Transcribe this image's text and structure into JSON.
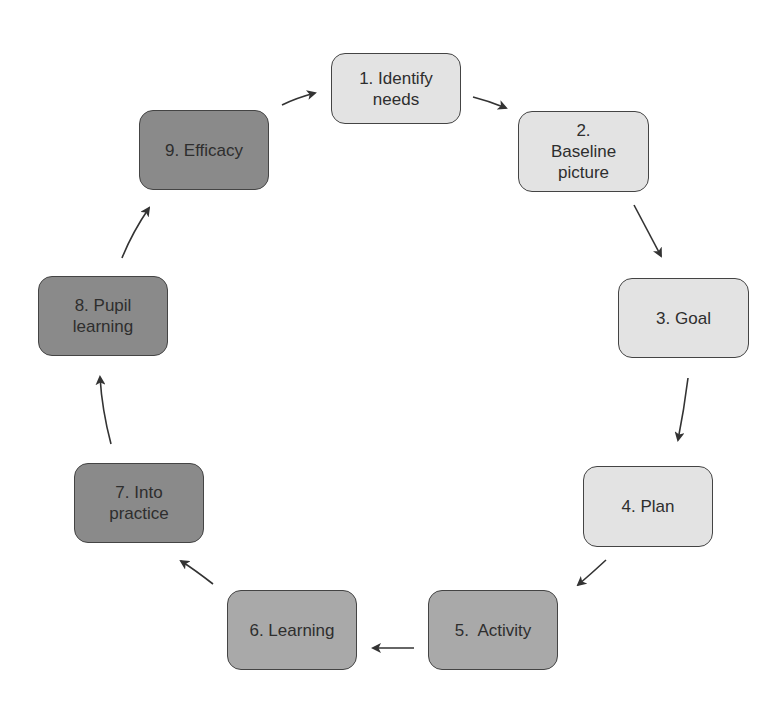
{
  "diagram": {
    "type": "cycle",
    "colors": {
      "light": "#e3e3e3",
      "medium": "#a9a9a9",
      "dark": "#8a8a8a",
      "border": "#444444",
      "arrow": "#333333",
      "text": "#2e2e2e"
    },
    "nodes": [
      {
        "id": 1,
        "label": "1. Identify\nneeds",
        "shade": "light"
      },
      {
        "id": 2,
        "label": "2.\nBaseline\npicture",
        "shade": "light"
      },
      {
        "id": 3,
        "label": "3. Goal",
        "shade": "light"
      },
      {
        "id": 4,
        "label": "4. Plan",
        "shade": "light"
      },
      {
        "id": 5,
        "label": "5.  Activity",
        "shade": "medium"
      },
      {
        "id": 6,
        "label": "6. Learning",
        "shade": "medium"
      },
      {
        "id": 7,
        "label": "7. Into\npractice",
        "shade": "dark"
      },
      {
        "id": 8,
        "label": "8. Pupil\nlearning",
        "shade": "dark"
      },
      {
        "id": 9,
        "label": "9. Efficacy",
        "shade": "dark"
      }
    ],
    "edges": [
      {
        "from": 1,
        "to": 2
      },
      {
        "from": 2,
        "to": 3
      },
      {
        "from": 3,
        "to": 4
      },
      {
        "from": 4,
        "to": 5
      },
      {
        "from": 5,
        "to": 6
      },
      {
        "from": 6,
        "to": 7
      },
      {
        "from": 7,
        "to": 8
      },
      {
        "from": 8,
        "to": 9
      },
      {
        "from": 9,
        "to": 1
      }
    ]
  }
}
